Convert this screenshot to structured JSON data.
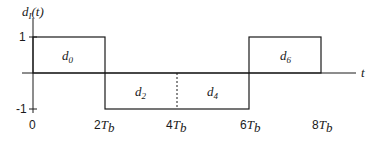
{
  "diagram": {
    "y_axis_label": "d",
    "y_axis_label_sub": "I",
    "y_axis_label_arg": "(t)",
    "x_axis_label": "t",
    "y_ticks": [
      "1",
      "-1"
    ],
    "x_ticks": [
      {
        "num": "0",
        "sym": "",
        "sub": ""
      },
      {
        "num": "2",
        "sym": "T",
        "sub": "b"
      },
      {
        "num": "4",
        "sym": "T",
        "sub": "b"
      },
      {
        "num": "6",
        "sym": "T",
        "sub": "b"
      },
      {
        "num": "8",
        "sym": "T",
        "sub": "b"
      }
    ],
    "pulses": [
      {
        "label": "d",
        "sub": "0",
        "level": 1,
        "start": 0,
        "end": 2
      },
      {
        "label": "d",
        "sub": "2",
        "level": -1,
        "start": 2,
        "end": 4
      },
      {
        "label": "d",
        "sub": "4",
        "level": -1,
        "start": 4,
        "end": 6
      },
      {
        "label": "d",
        "sub": "6",
        "level": 1,
        "start": 6,
        "end": 8
      }
    ],
    "colors": {
      "line": "#1a1a1a",
      "background": "#ffffff"
    }
  }
}
